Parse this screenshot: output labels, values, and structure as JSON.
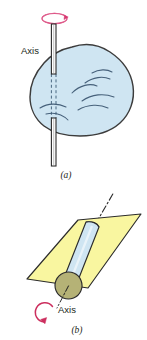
{
  "figure": {
    "panels": [
      {
        "id": "a",
        "caption": "(a)",
        "axis_label": "Axis",
        "description": "Irregular rigid body rotating about a fixed vertical axis rod",
        "body_color": "#cfe5f2",
        "body_outline_color": "#3c3c3c",
        "contour_line_color": "#46607a",
        "rod_color": "#ffffff",
        "rod_outline_color": "#2b2b2b",
        "hidden_rod_style": "dashed",
        "rotation_arrow_color": "#d6366f",
        "rotation_arrow_shape": "ellipse-with-arrowhead"
      },
      {
        "id": "b",
        "caption": "(b)",
        "axis_label": "Axis",
        "description": "Cylinder rotating about its own axis lying in an inclined plane",
        "plane_color": "#f9f6a0",
        "plane_outline_color": "#2b2b2b",
        "cylinder_color": "#cfe5f2",
        "cylinder_outline_color": "#2b2b2b",
        "end_cap_color": "#b5b276",
        "end_cap_outline_color": "#2b2b2b",
        "axis_line_style": "dash-dot",
        "axis_line_color": "#2b2b2b",
        "rotation_arrow_color": "#cc2f5e",
        "rotation_arrow_shape": "curved-arc-with-arrowhead"
      }
    ],
    "background_color": "#ffffff"
  }
}
